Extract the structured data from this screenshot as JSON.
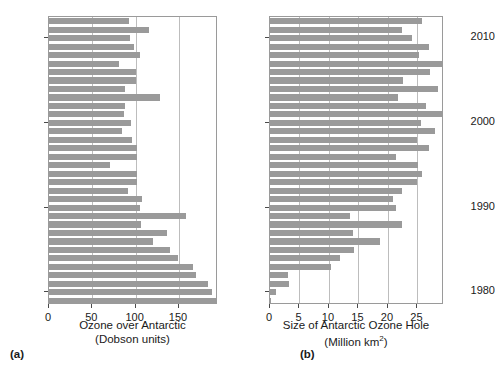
{
  "figure": {
    "background": "#ffffff",
    "bar_color": "#9a9a9a",
    "frame_color": "#9a9a9a",
    "grid_color": "#bdbdbd"
  },
  "panels": [
    {
      "caption": "(a)",
      "xlabel_line1": "Ozone over Antarctic",
      "xlabel_line2": "(Dobson units)",
      "xticks": [
        "0",
        "50",
        "100",
        "150"
      ],
      "yticks": [
        "2010",
        "2000",
        "1990",
        "1980"
      ]
    },
    {
      "caption": "(b)",
      "xlabel_line1": "Size of Antarctic Ozone Hole",
      "xlabel_line2_pre": "(Million km",
      "xlabel_line2_sup": "2",
      "xlabel_line2_post": ")",
      "xticks": [
        "0",
        "5",
        "10",
        "15",
        "20",
        "25"
      ],
      "yticks": [
        "2010",
        "2000",
        "1990",
        "1980"
      ]
    }
  ],
  "chart_data": [
    {
      "type": "bar",
      "orientation": "horizontal",
      "title": "",
      "xlabel": "Ozone over Antarctic (Dobson units)",
      "ylabel": "",
      "xlim": [
        0,
        195
      ],
      "ylim": [
        1978.5,
        2012.5
      ],
      "grid": "vertical",
      "legend": "none",
      "xticks": [
        0,
        50,
        100,
        150
      ],
      "yticks": [
        1980,
        1990,
        2000,
        2010
      ],
      "categories": [
        2012,
        2011,
        2010,
        2009,
        2008,
        2007,
        2006,
        2005,
        2004,
        2003,
        2002,
        2001,
        2000,
        1999,
        1998,
        1997,
        1996,
        1995,
        1994,
        1993,
        1992,
        1991,
        1990,
        1989,
        1988,
        1987,
        1986,
        1985,
        1984,
        1983,
        1982,
        1981,
        1980,
        1979
      ],
      "values": [
        92,
        115,
        93,
        98,
        105,
        81,
        100,
        100,
        88,
        128,
        88,
        86,
        95,
        84,
        96,
        101,
        102,
        70,
        101,
        102,
        91,
        107,
        105,
        158,
        106,
        136,
        120,
        140,
        149,
        166,
        170,
        184,
        188,
        194
      ],
      "values_label": "Ozone over Antarctic (Dobson units)"
    },
    {
      "type": "bar",
      "orientation": "horizontal",
      "title": "",
      "xlabel": "Size of Antarctic Ozone Hole (Million km2)",
      "ylabel": "",
      "xlim": [
        0,
        29.5
      ],
      "ylim": [
        1978.5,
        2012.5
      ],
      "grid": "vertical",
      "legend": "none",
      "xticks": [
        0,
        5,
        10,
        15,
        20,
        25
      ],
      "yticks": [
        1980,
        1990,
        2000,
        2010
      ],
      "categories": [
        2012,
        2011,
        2010,
        2009,
        2008,
        2007,
        2006,
        2005,
        2004,
        2003,
        2002,
        2001,
        2000,
        1999,
        1998,
        1997,
        1996,
        1995,
        1994,
        1993,
        1992,
        1991,
        1990,
        1989,
        1988,
        1987,
        1986,
        1985,
        1984,
        1983,
        1982,
        1981,
        1980,
        1979
      ],
      "values": [
        25.8,
        22.3,
        24.0,
        27.0,
        25.2,
        29.3,
        27.2,
        22.5,
        28.4,
        21.7,
        26.5,
        29.6,
        25.6,
        27.9,
        25.0,
        26.9,
        21.3,
        25.1,
        25.7,
        24.9,
        22.3,
        20.8,
        21.4,
        13.5,
        22.3,
        14.0,
        18.6,
        14.3,
        11.9,
        10.4,
        3.0,
        3.2,
        1.1,
        0.1
      ],
      "values_label": "Size of Antarctic Ozone Hole (Million km²)"
    }
  ]
}
